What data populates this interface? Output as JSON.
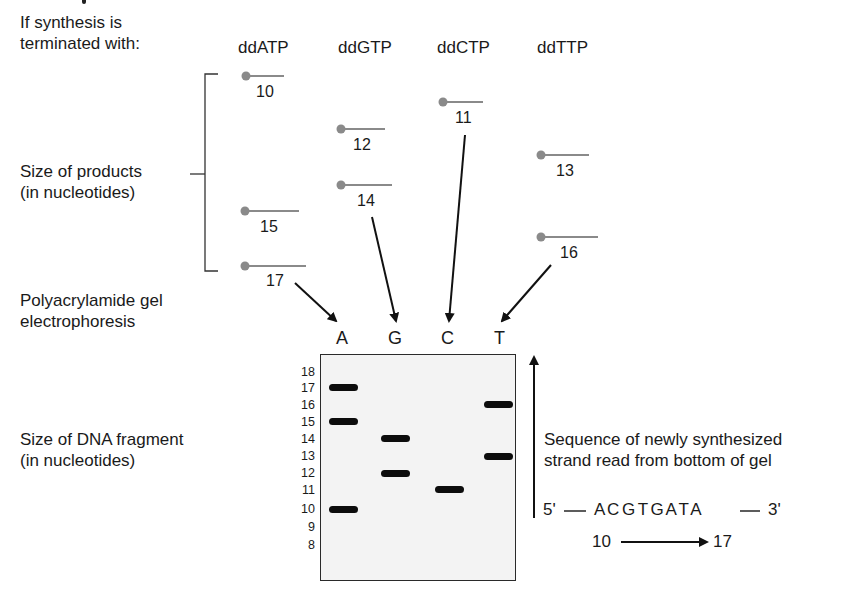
{
  "left_labels": {
    "termination_line1": "If synthesis is",
    "termination_line2": "terminated with:",
    "products_line1": "Size of products",
    "products_line2": "(in nucleotides)",
    "electrophoresis_line1": "Polyacrylamide gel",
    "electrophoresis_line2": "electrophoresis",
    "fragment_line1": "Size of DNA fragment",
    "fragment_line2": "(in nucleotides)"
  },
  "terminators": [
    {
      "name": "ddATP",
      "lane": "A",
      "products": [
        10,
        15,
        17
      ]
    },
    {
      "name": "ddGTP",
      "lane": "G",
      "products": [
        12,
        14
      ]
    },
    {
      "name": "ddCTP",
      "lane": "C",
      "products": [
        11
      ]
    },
    {
      "name": "ddTTP",
      "lane": "T",
      "products": [
        13,
        16
      ]
    }
  ],
  "product_labels": {
    "a10": "10",
    "a15": "15",
    "a17": "17",
    "g12": "12",
    "g14": "14",
    "c11": "11",
    "t13": "13",
    "t16": "16"
  },
  "gel": {
    "lanes": [
      "A",
      "G",
      "C",
      "T"
    ],
    "size_ticks": [
      "18",
      "17",
      "16",
      "15",
      "14",
      "13",
      "12",
      "11",
      "10",
      "9",
      "8"
    ],
    "bands": [
      {
        "lane": "A",
        "size": 17
      },
      {
        "lane": "A",
        "size": 15
      },
      {
        "lane": "A",
        "size": 10
      },
      {
        "lane": "G",
        "size": 14
      },
      {
        "lane": "G",
        "size": 12
      },
      {
        "lane": "C",
        "size": 11
      },
      {
        "lane": "T",
        "size": 16
      },
      {
        "lane": "T",
        "size": 13
      }
    ]
  },
  "sequence": {
    "caption_line1": "Sequence of newly synthesized",
    "caption_line2": "strand read from bottom of gel",
    "five_prime": "5'",
    "bases": "ACGTGATA",
    "bases_display": "A C G T G A T A",
    "three_prime": "3'",
    "range_start": "10",
    "range_end": "17"
  },
  "colors": {
    "text": "#1a1a1a",
    "product_line": "#8a8a8a",
    "product_dot": "#8a8a8a",
    "gel_background": "#f3f3f3",
    "band": "#0c0c0c"
  }
}
